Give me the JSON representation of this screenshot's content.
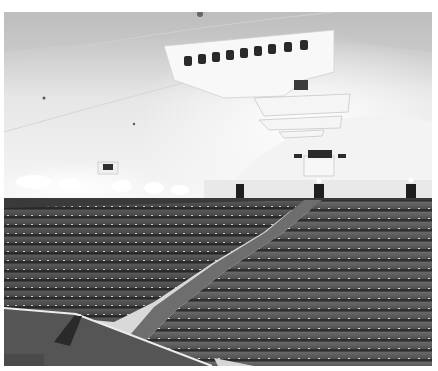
{
  "image": {
    "subject": "Black-and-white photograph of a large cinema auditorium interior with a barrel-vaulted ceiling and rows of seats",
    "palette": {
      "ceiling_light": "#f2f2f2",
      "ceiling_shadow": "#a9a9a9",
      "wall": "#e6e6e6",
      "dado": "#3a3a3a",
      "seats": "#4a4a4a",
      "seat_dark": "#2c2c2c",
      "aisle": "#6e6e6e",
      "balcony_floor": "#5a5a5a",
      "balcony_rail": "#e8e8e8"
    },
    "regions": [
      {
        "name": "barrel-vault-ceiling"
      },
      {
        "name": "projection-booth-ports",
        "count": 9
      },
      {
        "name": "ceiling-light-coves",
        "count": 3
      },
      {
        "name": "rear-wall-with-exit-doors",
        "doors": 3
      },
      {
        "name": "left-seating-block"
      },
      {
        "name": "right-seating-block"
      },
      {
        "name": "center-aisle"
      },
      {
        "name": "balcony-front-foreground"
      }
    ]
  }
}
